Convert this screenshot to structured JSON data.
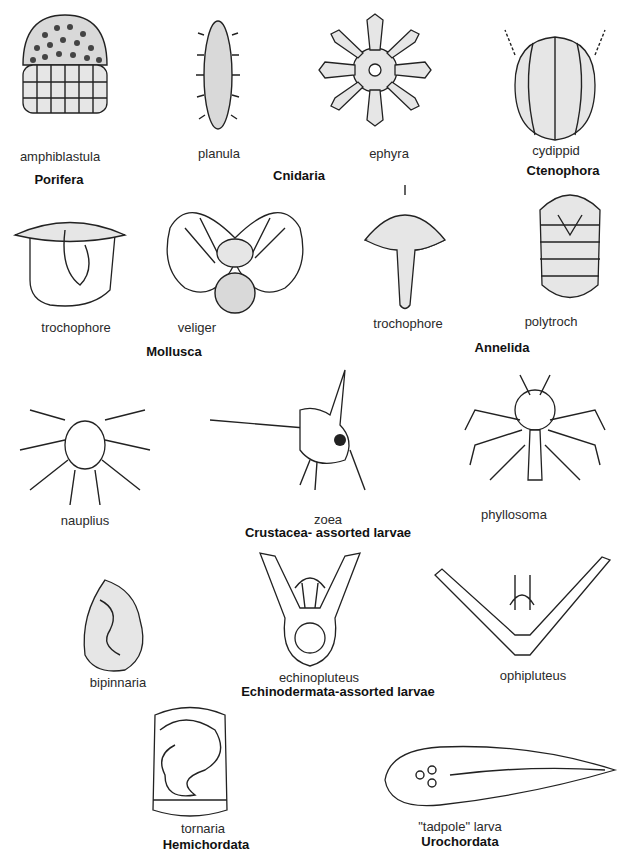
{
  "figure": {
    "organisms": [
      {
        "id": "amphiblastula",
        "label": "amphiblastula",
        "group": "Porifera"
      },
      {
        "id": "planula",
        "label": "planula",
        "group": "Cnidaria"
      },
      {
        "id": "ephyra",
        "label": "ephyra",
        "group": "Cnidaria"
      },
      {
        "id": "cydippid",
        "label": "cydippid",
        "group": "Ctenophora"
      },
      {
        "id": "trochophore-mollusca",
        "label": "trochophore",
        "group": "Mollusca"
      },
      {
        "id": "veliger",
        "label": "veliger",
        "group": "Mollusca"
      },
      {
        "id": "trochophore-annelida",
        "label": "trochophore",
        "group": "Annelida"
      },
      {
        "id": "polytroch",
        "label": "polytroch",
        "group": "Annelida"
      },
      {
        "id": "nauplius",
        "label": "nauplius",
        "group": "Crustacea- assorted larvae"
      },
      {
        "id": "zoea",
        "label": "zoea",
        "group": "Crustacea- assorted larvae"
      },
      {
        "id": "phyllosoma",
        "label": "phyllosoma",
        "group": "Crustacea- assorted larvae"
      },
      {
        "id": "bipinnaria",
        "label": "bipinnaria",
        "group": "Echinodermata-assorted larvae"
      },
      {
        "id": "echinopluteus",
        "label": "echinopluteus",
        "group": "Echinodermata-assorted larvae"
      },
      {
        "id": "ophipluteus",
        "label": "ophipluteus",
        "group": "Echinodermata-assorted larvae"
      },
      {
        "id": "tornaria",
        "label": "tornaria",
        "group": "Hemichordata"
      },
      {
        "id": "tadpole",
        "label": "\"tadpole\" larva",
        "group": "Urochordata"
      }
    ],
    "groups": {
      "porifera": "Porifera",
      "cnidaria": "Cnidaria",
      "ctenophora": "Ctenophora",
      "mollusca": "Mollusca",
      "annelida": "Annelida",
      "crustacea": "Crustacea- assorted larvae",
      "echinodermata": "Echinodermata-assorted larvae",
      "hemichordata": "Hemichordata",
      "urochordata": "Urochordata"
    }
  }
}
